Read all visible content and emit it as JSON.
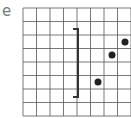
{
  "label": "e",
  "grid": {
    "x0": 23,
    "y0": 8,
    "cell": 13.5,
    "cols": 8,
    "rows": 8,
    "color": "#555555"
  },
  "bracket": {
    "x": 78,
    "y_top": 29,
    "y_bottom": 97,
    "tick": 5,
    "color": "#333333"
  },
  "points": [
    {
      "x": 98,
      "y": 82
    },
    {
      "x": 112,
      "y": 55
    },
    {
      "x": 125,
      "y": 42
    }
  ],
  "point_color": "#222222"
}
